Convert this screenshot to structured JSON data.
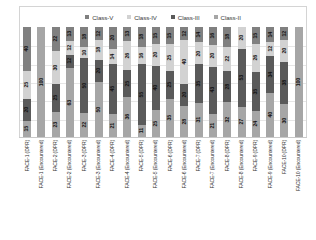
{
  "chart_data": {
    "type": "bar",
    "subtype": "100% stacked column",
    "title": "",
    "xlabel": "",
    "ylabel": "",
    "ylim": [
      0,
      100
    ],
    "grid": true,
    "legend_position": "top-center",
    "legend": [
      "Class-V",
      "Class-IV",
      "Class-III",
      "Class-II"
    ],
    "series_colors": {
      "Class-V": "#808080",
      "Class-IV": "#d2d2d2",
      "Class-III": "#5a5a5a",
      "Class-II": "#a6a6a6"
    },
    "categories": [
      "FACE-1 (DPR)",
      "FACE-1 (Encountered)",
      "FACE-2 (DPR)",
      "FACE-2 (Encountered)",
      "FACE-3 (DPR)",
      "FACE-3 (Encountered)",
      "FACE-4 (DPR)",
      "FACE-4 (Encountered)",
      "FACE-5 (DPR)",
      "FACE-5 (Encountered)",
      "FACE-6 (DPR)",
      "FACE-6 (Encountered)",
      "FACE-7 (DPR)",
      "FACE-7 (Encountered)",
      "FACE-8 (DPR)",
      "FACE-8 (Encountered)",
      "FACE-9 (DPR)",
      "FACE-9 (Encountered)",
      "FACE-10 (DPR)",
      "FACE-10 (Encountered)"
    ],
    "series": [
      {
        "name": "Class-V",
        "values": [
          40,
          0,
          22,
          13,
          18,
          12,
          20,
          13,
          18,
          15,
          15,
          12,
          14,
          16,
          18,
          0,
          15,
          14,
          12,
          0
        ]
      },
      {
        "name": "Class-IV",
        "values": [
          25,
          0,
          30,
          12,
          10,
          18,
          14,
          26,
          16,
          20,
          25,
          40,
          20,
          20,
          22,
          20,
          26,
          12,
          20,
          0
        ]
      },
      {
        "name": "Class-III",
        "values": [
          20,
          0,
          25,
          12,
          50,
          20,
          45,
          25,
          55,
          40,
          25,
          20,
          35,
          43,
          28,
          53,
          35,
          34,
          38,
          0
        ]
      },
      {
        "name": "Class-II",
        "values": [
          15,
          100,
          23,
          63,
          22,
          50,
          21,
          36,
          11,
          25,
          35,
          28,
          31,
          21,
          32,
          27,
          24,
          40,
          30,
          100
        ]
      }
    ],
    "bars": [
      {
        "category": "FACE-1 (DPR)",
        "segments": [
          {
            "cls": "Class-V",
            "value": 40,
            "label": "40"
          },
          {
            "cls": "Class-IV",
            "value": 25,
            "label": "25"
          },
          {
            "cls": "Class-III",
            "value": 20,
            "label": "20"
          },
          {
            "cls": "Class-II",
            "value": 15,
            "label": "15"
          }
        ]
      },
      {
        "category": "FACE-1 (Encountered)",
        "segments": [
          {
            "cls": "Class-II",
            "value": 100,
            "label": "100"
          }
        ]
      },
      {
        "category": "FACE-2 (DPR)",
        "segments": [
          {
            "cls": "Class-V",
            "value": 22,
            "label": "22"
          },
          {
            "cls": "Class-IV",
            "value": 30,
            "label": "30"
          },
          {
            "cls": "Class-III",
            "value": 25,
            "label": "25"
          },
          {
            "cls": "Class-II",
            "value": 23,
            "label": "23"
          }
        ]
      },
      {
        "category": "FACE-2 (Encountered)",
        "segments": [
          {
            "cls": "Class-V",
            "value": 13,
            "label": "13"
          },
          {
            "cls": "Class-IV",
            "value": 12,
            "label": "12"
          },
          {
            "cls": "Class-III",
            "value": 12,
            "label": "12"
          },
          {
            "cls": "Class-II",
            "value": 63,
            "label": "63"
          }
        ]
      },
      {
        "category": "FACE-3 (DPR)",
        "segments": [
          {
            "cls": "Class-V",
            "value": 18,
            "label": "18"
          },
          {
            "cls": "Class-IV",
            "value": 10,
            "label": "10"
          },
          {
            "cls": "Class-III",
            "value": 50,
            "label": "50"
          },
          {
            "cls": "Class-II",
            "value": 22,
            "label": "22"
          }
        ]
      },
      {
        "category": "FACE-3 (Encountered)",
        "segments": [
          {
            "cls": "Class-V",
            "value": 12,
            "label": "12"
          },
          {
            "cls": "Class-IV",
            "value": 18,
            "label": "18"
          },
          {
            "cls": "Class-III",
            "value": 20,
            "label": "20"
          },
          {
            "cls": "Class-II",
            "value": 50,
            "label": "50"
          }
        ]
      },
      {
        "category": "FACE-4 (DPR)",
        "segments": [
          {
            "cls": "Class-V",
            "value": 20,
            "label": "20"
          },
          {
            "cls": "Class-IV",
            "value": 14,
            "label": "14"
          },
          {
            "cls": "Class-III",
            "value": 45,
            "label": "45"
          },
          {
            "cls": "Class-II",
            "value": 21,
            "label": "21"
          }
        ]
      },
      {
        "category": "FACE-4 (Encountered)",
        "segments": [
          {
            "cls": "Class-V",
            "value": 13,
            "label": "13"
          },
          {
            "cls": "Class-IV",
            "value": 26,
            "label": "26"
          },
          {
            "cls": "Class-III",
            "value": 25,
            "label": "25"
          },
          {
            "cls": "Class-II",
            "value": 36,
            "label": "36"
          }
        ]
      },
      {
        "category": "FACE-5 (DPR)",
        "segments": [
          {
            "cls": "Class-V",
            "value": 18,
            "label": "18"
          },
          {
            "cls": "Class-IV",
            "value": 16,
            "label": "16"
          },
          {
            "cls": "Class-III",
            "value": 55,
            "label": "55"
          },
          {
            "cls": "Class-II",
            "value": 11,
            "label": "11"
          }
        ]
      },
      {
        "category": "FACE-5 (Encountered)",
        "segments": [
          {
            "cls": "Class-V",
            "value": 15,
            "label": "15"
          },
          {
            "cls": "Class-IV",
            "value": 20,
            "label": "20"
          },
          {
            "cls": "Class-III",
            "value": 40,
            "label": "40"
          },
          {
            "cls": "Class-II",
            "value": 25,
            "label": "25"
          }
        ]
      },
      {
        "category": "FACE-6 (DPR)",
        "segments": [
          {
            "cls": "Class-V",
            "value": 15,
            "label": "15"
          },
          {
            "cls": "Class-IV",
            "value": 25,
            "label": "25"
          },
          {
            "cls": "Class-III",
            "value": 25,
            "label": "25"
          },
          {
            "cls": "Class-II",
            "value": 35,
            "label": "35"
          }
        ]
      },
      {
        "category": "FACE-6 (Encountered)",
        "segments": [
          {
            "cls": "Class-V",
            "value": 12,
            "label": "12"
          },
          {
            "cls": "Class-IV",
            "value": 40,
            "label": "40"
          },
          {
            "cls": "Class-III",
            "value": 20,
            "label": "20"
          },
          {
            "cls": "Class-II",
            "value": 28,
            "label": "28"
          }
        ]
      },
      {
        "category": "FACE-7 (DPR)",
        "segments": [
          {
            "cls": "Class-V",
            "value": 14,
            "label": "14"
          },
          {
            "cls": "Class-IV",
            "value": 20,
            "label": "20"
          },
          {
            "cls": "Class-III",
            "value": 35,
            "label": "35"
          },
          {
            "cls": "Class-II",
            "value": 31,
            "label": "31"
          }
        ]
      },
      {
        "category": "FACE-7 (Encountered)",
        "segments": [
          {
            "cls": "Class-V",
            "value": 16,
            "label": "16"
          },
          {
            "cls": "Class-IV",
            "value": 20,
            "label": "20"
          },
          {
            "cls": "Class-III",
            "value": 43,
            "label": "43"
          },
          {
            "cls": "Class-II",
            "value": 21,
            "label": "21"
          }
        ]
      },
      {
        "category": "FACE-8 (DPR)",
        "segments": [
          {
            "cls": "Class-V",
            "value": 18,
            "label": "18"
          },
          {
            "cls": "Class-IV",
            "value": 22,
            "label": "22"
          },
          {
            "cls": "Class-III",
            "value": 28,
            "label": "28"
          },
          {
            "cls": "Class-II",
            "value": 32,
            "label": "32"
          }
        ]
      },
      {
        "category": "FACE-8 (Encountered)",
        "segments": [
          {
            "cls": "Class-IV",
            "value": 20,
            "label": "20"
          },
          {
            "cls": "Class-III",
            "value": 53,
            "label": "53"
          },
          {
            "cls": "Class-II",
            "value": 27,
            "label": "27"
          }
        ]
      },
      {
        "category": "FACE-9 (DPR)",
        "segments": [
          {
            "cls": "Class-V",
            "value": 15,
            "label": "15"
          },
          {
            "cls": "Class-IV",
            "value": 26,
            "label": "26"
          },
          {
            "cls": "Class-III",
            "value": 35,
            "label": "35"
          },
          {
            "cls": "Class-II",
            "value": 24,
            "label": "24"
          }
        ]
      },
      {
        "category": "FACE-9 (Encountered)",
        "segments": [
          {
            "cls": "Class-V",
            "value": 14,
            "label": "14"
          },
          {
            "cls": "Class-IV",
            "value": 12,
            "label": "12"
          },
          {
            "cls": "Class-III",
            "value": 34,
            "label": "34"
          },
          {
            "cls": "Class-II",
            "value": 40,
            "label": "40"
          }
        ]
      },
      {
        "category": "FACE-10 (DPR)",
        "segments": [
          {
            "cls": "Class-V",
            "value": 12,
            "label": "12"
          },
          {
            "cls": "Class-IV",
            "value": 20,
            "label": "20"
          },
          {
            "cls": "Class-III",
            "value": 38,
            "label": "38"
          },
          {
            "cls": "Class-II",
            "value": 30,
            "label": "30"
          }
        ]
      },
      {
        "category": "FACE-10 (Encountered)",
        "segments": [
          {
            "cls": "Class-II",
            "value": 100,
            "label": "100"
          }
        ]
      }
    ],
    "gridline_count": 5
  }
}
